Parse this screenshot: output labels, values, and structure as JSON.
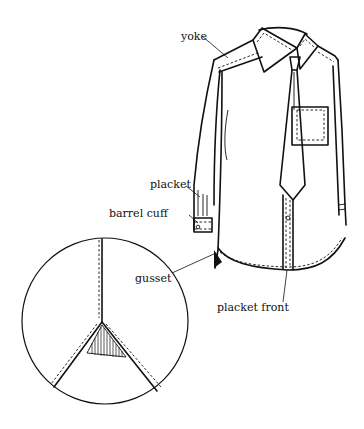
{
  "diagram": {
    "labels": {
      "yoke": "yoke",
      "placket": "placket",
      "barrel_cuff": "barrel cuff",
      "gusset": "gusset",
      "placket_front": "placket front"
    },
    "inset": "gusset detail (magnified circle)"
  }
}
